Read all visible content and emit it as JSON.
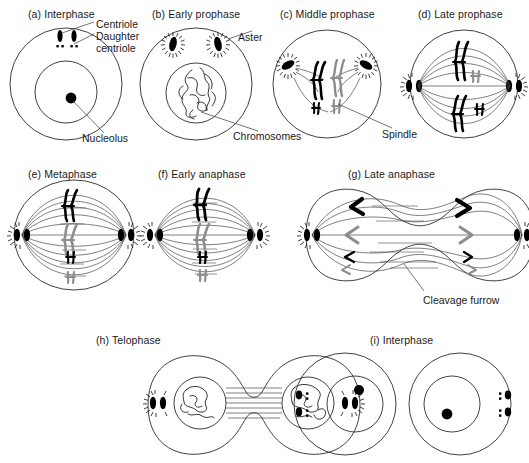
{
  "figure": {
    "kind": "biology-diagram",
    "background_color": "#ffffff",
    "line_color": "#2b2b2b",
    "chromosome_colors": {
      "paternal": "#000000",
      "maternal": "#8d8d8d"
    }
  },
  "panels": [
    {
      "id": "a",
      "label": "(a)  Interphase",
      "title_x": 28,
      "title_y": 8
    },
    {
      "id": "b",
      "label": "(b)  Early prophase",
      "title_x": 152,
      "title_y": 8
    },
    {
      "id": "c",
      "label": "(c)  Middle prophase",
      "title_x": 280,
      "title_y": 8
    },
    {
      "id": "d",
      "label": "(d)  Late prophase",
      "title_x": 418,
      "title_y": 8
    },
    {
      "id": "e",
      "label": "(e)  Metaphase",
      "title_x": 28,
      "title_y": 168
    },
    {
      "id": "f",
      "label": "(f)  Early anaphase",
      "title_x": 158,
      "title_y": 168
    },
    {
      "id": "g",
      "label": "(g)  Late anaphase",
      "title_x": 348,
      "title_y": 168
    },
    {
      "id": "h",
      "label": "(h)  Telophase",
      "title_x": 96,
      "title_y": 334
    },
    {
      "id": "i",
      "label": "(i)  Interphase",
      "title_x": 370,
      "title_y": 334
    }
  ],
  "callouts": [
    {
      "id": "centriole",
      "text": "Centriole",
      "x": 96,
      "y": 18
    },
    {
      "id": "daughter",
      "text": "Daughter",
      "x": 96,
      "y": 30
    },
    {
      "id": "daughter2",
      "text": "centriole",
      "x": 96,
      "y": 42
    },
    {
      "id": "nucleolus",
      "text": "Nucleolus",
      "x": 82,
      "y": 132
    },
    {
      "id": "aster",
      "text": "Aster",
      "x": 238,
      "y": 31
    },
    {
      "id": "chromosomes",
      "text": "Chromosomes",
      "x": 233,
      "y": 130
    },
    {
      "id": "spindle",
      "text": "Spindle",
      "x": 382,
      "y": 128
    },
    {
      "id": "cleavage-furrow",
      "text": "Cleavage furrow",
      "x": 423,
      "y": 294
    }
  ],
  "stage_details": {
    "a": {
      "structures": [
        "cell membrane",
        "nuclear envelope",
        "nucleolus",
        "centriole pair",
        "daughter centriole"
      ],
      "chromosome_count": 0
    },
    "b": {
      "structures": [
        "cell membrane",
        "nuclear envelope",
        "two asters",
        "chromatin threads"
      ],
      "chromosome_count": 0
    },
    "c": {
      "structures": [
        "cell membrane",
        "two asters",
        "spindle fibers",
        "condensed chromosomes"
      ],
      "chromosome_count": 4
    },
    "d": {
      "structures": [
        "cell membrane",
        "polar asters",
        "full spindle",
        "chromosomes"
      ],
      "chromosome_count": 4
    },
    "e": {
      "structures": [
        "spindle",
        "metaphase plate",
        "chromosomes aligned at equator"
      ],
      "chromosome_count": 4
    },
    "f": {
      "structures": [
        "spindle",
        "chromatids separating"
      ],
      "chromosome_count": 4
    },
    "g": {
      "structures": [
        "elongated spindle",
        "V-shaped chromatids at poles",
        "cleavage furrow"
      ],
      "chromosome_count": 8
    },
    "h": {
      "structures": [
        "two daughter nuclei",
        "interzonal fibers",
        "asters",
        "deep cleavage furrow"
      ],
      "chromosome_count": 0
    },
    "i": {
      "structures": [
        "two daughter cells",
        "nuclei",
        "nucleoli",
        "centriole pairs"
      ],
      "chromosome_count": 0
    }
  }
}
